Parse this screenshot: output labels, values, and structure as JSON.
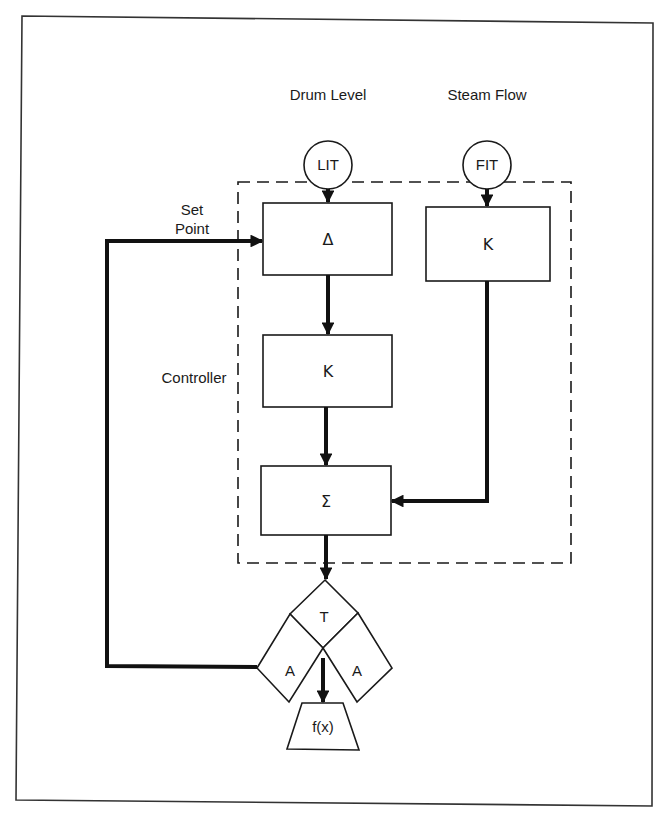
{
  "diagram": {
    "inputs": {
      "drum_level": {
        "label": "Drum Level",
        "instrument": "LIT"
      },
      "steam_flow": {
        "label": "Steam Flow",
        "instrument": "FIT"
      }
    },
    "labels": {
      "set_point_line1": "Set",
      "set_point_line2": "Point",
      "controller": "Controller"
    },
    "blocks": {
      "delta": "Δ",
      "gain_level": "K",
      "gain_steam": "K",
      "summer": "Σ",
      "transfer": "T",
      "auto_left": "A",
      "auto_right": "A",
      "final_element": "f(x)"
    },
    "colors": {
      "line": "#111111",
      "background": "#ffffff"
    }
  }
}
